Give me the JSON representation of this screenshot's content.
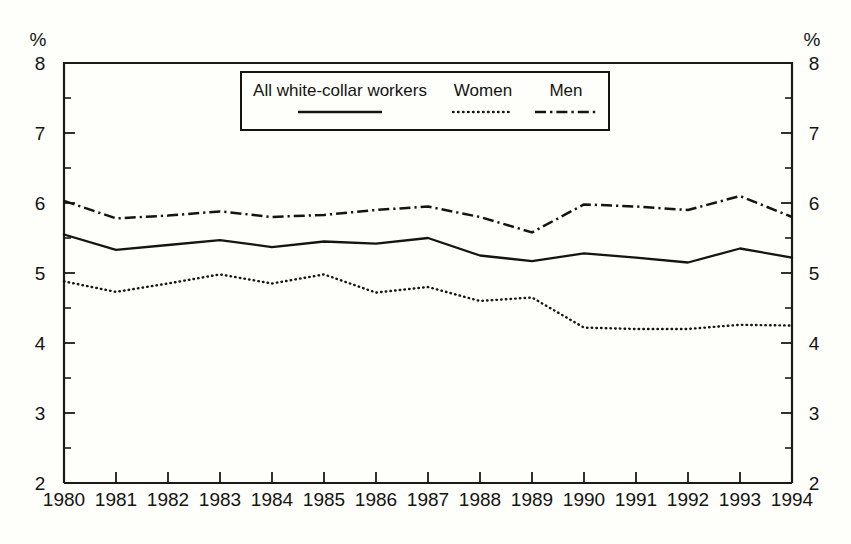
{
  "chart_data": {
    "type": "line",
    "title": "",
    "subtitle": "",
    "xlabel": "",
    "ylabel": "%",
    "ylabel_right": "%",
    "categories": [
      "1980",
      "1981",
      "1982",
      "1983",
      "1984",
      "1985",
      "1986",
      "1987",
      "1988",
      "1989",
      "1990",
      "1991",
      "1992",
      "1993",
      "1994"
    ],
    "x": [
      1980,
      1981,
      1982,
      1983,
      1984,
      1985,
      1986,
      1987,
      1988,
      1989,
      1990,
      1991,
      1992,
      1993,
      1994
    ],
    "ylim": [
      2,
      8
    ],
    "xlim": [
      1980,
      1994
    ],
    "y_ticks": [
      2,
      3,
      4,
      5,
      6,
      7,
      8
    ],
    "y_tick_labels": [
      "2",
      "3",
      "4",
      "5",
      "6",
      "7",
      "8"
    ],
    "y_minor_ticks": [
      2.5,
      3.5,
      4.5,
      5.5,
      6.5,
      7.5
    ],
    "grid": false,
    "legend_position": "top-center",
    "series": [
      {
        "name": "All white-collar workers",
        "style": "solid",
        "values": [
          5.55,
          5.33,
          5.4,
          5.47,
          5.37,
          5.45,
          5.42,
          5.5,
          5.25,
          5.17,
          5.28,
          5.22,
          5.15,
          5.35,
          5.22
        ]
      },
      {
        "name": "Women",
        "style": "dotted",
        "values": [
          4.88,
          4.73,
          4.85,
          4.98,
          4.85,
          4.98,
          4.72,
          4.8,
          4.6,
          4.65,
          4.22,
          4.2,
          4.2,
          4.26,
          4.25
        ]
      },
      {
        "name": "Men",
        "style": "dash-dot",
        "values": [
          6.03,
          5.78,
          5.82,
          5.88,
          5.8,
          5.83,
          5.9,
          5.95,
          5.8,
          5.58,
          5.98,
          5.95,
          5.9,
          6.1,
          5.8
        ]
      }
    ]
  },
  "axes": {
    "unit_left": "%",
    "unit_right": "%"
  },
  "legend": {
    "items": [
      {
        "label": "All white-collar workers"
      },
      {
        "label": "Women"
      },
      {
        "label": "Men"
      }
    ]
  },
  "colors": {
    "ink": "#141412",
    "background": "#fefefa"
  }
}
